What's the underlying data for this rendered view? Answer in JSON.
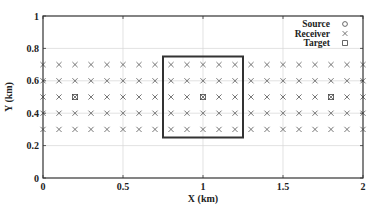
{
  "chart_data": {
    "type": "scatter",
    "title": "",
    "xlabel": "X (km)",
    "ylabel": "Y (km)",
    "xlim": [
      0,
      2
    ],
    "ylim": [
      0,
      1
    ],
    "xticks": [
      0,
      0.5,
      1,
      1.5,
      2
    ],
    "xtick_labels": [
      "0",
      "0.5",
      "1",
      "1.5",
      "2"
    ],
    "yticks": [
      0,
      0.2,
      0.4,
      0.6,
      0.8,
      1
    ],
    "ytick_labels": [
      "0",
      "0.2",
      "0.4",
      "0.6",
      "0.8",
      "1"
    ],
    "grid": true,
    "legend_position": "top-right",
    "legend": [
      {
        "label": "Source",
        "marker": "circle"
      },
      {
        "label": "Receiver",
        "marker": "cross"
      },
      {
        "label": "Target",
        "marker": "square"
      }
    ],
    "series": [
      {
        "name": "Source",
        "marker": "circle",
        "points": []
      },
      {
        "name": "Receiver",
        "marker": "cross",
        "grid_x": {
          "start": 0,
          "stop": 2,
          "step": 0.1
        },
        "grid_y": [
          0.3,
          0.4,
          0.5,
          0.6,
          0.7
        ]
      },
      {
        "name": "Target",
        "marker": "square",
        "points": [
          [
            0.2,
            0.5
          ],
          [
            1.0,
            0.5
          ],
          [
            1.8,
            0.5
          ]
        ]
      }
    ],
    "annotations": [
      {
        "type": "rectangle",
        "x": [
          0.75,
          1.25
        ],
        "y": [
          0.25,
          0.75
        ]
      }
    ]
  }
}
